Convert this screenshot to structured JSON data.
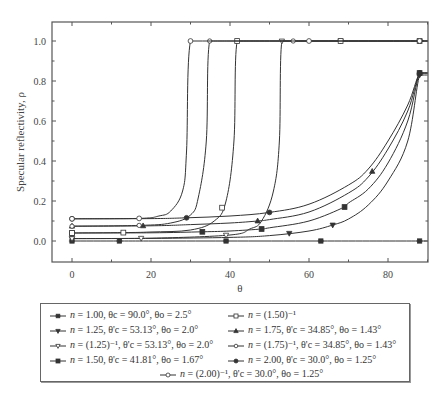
{
  "chart_data": {
    "type": "line",
    "title": "",
    "xlabel": "θ",
    "ylabel": "Specular reflectivity, ρ",
    "xlim": [
      -5,
      90
    ],
    "ylim": [
      -0.105,
      1.095
    ],
    "xticks": [
      0,
      20,
      40,
      60,
      80
    ],
    "yticks": [
      0.0,
      0.2,
      0.4,
      0.6,
      0.8,
      1.0
    ],
    "grid": false,
    "legend_position": "below",
    "series": [
      {
        "name": "n = 1.00, θc = 90.0°, θo = 2.5°",
        "marker": "asterisk",
        "x": [
          0,
          12,
          21,
          39,
          63,
          88,
          90
        ],
        "y": [
          0,
          0,
          0,
          0,
          0,
          0,
          0
        ]
      },
      {
        "name": "n = 1.25, θ'c = 53.13°, θo = 2.0°",
        "marker": "triangle-down-filled",
        "x": [
          0,
          20,
          40,
          50,
          60,
          66,
          70,
          75,
          80,
          85,
          88,
          90
        ],
        "y": [
          0.012,
          0.013,
          0.018,
          0.027,
          0.05,
          0.08,
          0.11,
          0.18,
          0.3,
          0.5,
          0.83,
          0.83
        ]
      },
      {
        "name": "n = (1.25)⁻¹, θ'c = 53.13°, θo = 2.0°",
        "marker": "triangle-down-open",
        "x": [
          0,
          20,
          40,
          45,
          48,
          51,
          52.5,
          53.13,
          60,
          70,
          80,
          90
        ],
        "y": [
          0.012,
          0.014,
          0.03,
          0.06,
          0.1,
          0.25,
          0.5,
          1.0,
          1.0,
          1.0,
          1.0,
          1.0
        ]
      },
      {
        "name": "n = 1.50, θ'c = 41.81°, θo = 1.67°",
        "marker": "square-filled",
        "x": [
          0,
          20,
          33,
          40,
          48,
          50,
          60,
          69,
          70,
          75,
          80,
          85,
          88,
          90
        ],
        "y": [
          0.04,
          0.041,
          0.046,
          0.05,
          0.06,
          0.066,
          0.1,
          0.17,
          0.19,
          0.26,
          0.39,
          0.6,
          0.84,
          0.84
        ]
      },
      {
        "name": "n = (1.50)⁻¹",
        "marker": "square-open",
        "x": [
          0,
          13,
          20,
          30,
          36,
          39,
          41,
          41.81,
          50,
          60,
          70,
          80,
          90
        ],
        "y": [
          0.04,
          0.042,
          0.045,
          0.055,
          0.1,
          0.2,
          0.5,
          1.0,
          1.0,
          1.0,
          1.0,
          1.0,
          1.0
        ]
      },
      {
        "name": "n = 1.75, θ'c = 34.85°, θo = 1.43°",
        "marker": "triangle-up-filled",
        "x": [
          0,
          20,
          30,
          40,
          47,
          50,
          60,
          70,
          75,
          80,
          85,
          88,
          90
        ],
        "y": [
          0.074,
          0.076,
          0.082,
          0.09,
          0.1,
          0.107,
          0.145,
          0.24,
          0.32,
          0.46,
          0.65,
          0.84,
          0.84
        ]
      },
      {
        "name": "n = (1.75)⁻¹, θ'c = 34.85°, θo = 1.43°",
        "marker": "circle-open-small",
        "x": [
          0,
          17,
          25,
          30,
          32,
          34,
          34.85,
          40,
          50,
          60,
          70,
          80,
          90
        ],
        "y": [
          0.074,
          0.078,
          0.09,
          0.13,
          0.22,
          0.5,
          1.0,
          1.0,
          1.0,
          1.0,
          1.0,
          1.0,
          1.0
        ]
      },
      {
        "name": "n = 2.00, θ'c = 30.0°, θo = 1.25°",
        "marker": "circle-filled",
        "x": [
          0,
          20,
          29,
          40,
          50,
          60,
          70,
          75,
          80,
          85,
          88,
          90
        ],
        "y": [
          0.111,
          0.112,
          0.116,
          0.125,
          0.143,
          0.184,
          0.28,
          0.36,
          0.5,
          0.68,
          0.84,
          0.84
        ]
      },
      {
        "name": "n = (2.00)⁻¹, θ'c = 30.0°, θo = 1.25°",
        "marker": "circle-open",
        "x": [
          0,
          17,
          22,
          25,
          28,
          29,
          30,
          40,
          50,
          60,
          70,
          80,
          90
        ],
        "y": [
          0.111,
          0.113,
          0.125,
          0.15,
          0.25,
          0.45,
          1.0,
          1.0,
          1.0,
          1.0,
          1.0,
          1.0,
          1.0
        ]
      }
    ]
  },
  "axes": {
    "xlabel": "θ",
    "ylabel": "Specular reflectivity, ρ",
    "xtick_labels": [
      "0",
      "20",
      "40",
      "60",
      "80"
    ],
    "ytick_labels": [
      "0.0",
      "0.2",
      "0.4",
      "0.6",
      "0.8",
      "1.0"
    ]
  },
  "legend": {
    "items": [
      {
        "pre": "",
        "n": "n",
        "text": " = 1.00, θc = 90.0°, θo = 2.5°"
      },
      {
        "pre": "",
        "n": "n",
        "text": " = (1.50)⁻¹"
      },
      {
        "pre": "",
        "n": "n",
        "text": " = 1.25, θ'c = 53.13°, θo = 2.0°"
      },
      {
        "pre": "",
        "n": "n",
        "text": " = 1.75, θ'c = 34.85°, θo = 1.43°"
      },
      {
        "pre": "",
        "n": "n",
        "text": " = (1.25)⁻¹, θ'c = 53.13°, θo = 2.0°"
      },
      {
        "pre": "",
        "n": "n",
        "text": " = (1.75)⁻¹, θ'c = 34.85°, θo = 1.43°"
      },
      {
        "pre": "",
        "n": "n",
        "text": " = 1.50, θ'c = 41.81°, θo = 1.67°"
      },
      {
        "pre": "",
        "n": "n",
        "text": " = 2.00, θ'c = 30.0°, θo = 1.25°"
      },
      {
        "pre": "",
        "n": "n",
        "text": " = (2.00)⁻¹, θ'c = 30.0°, θo = 1.25°"
      }
    ]
  },
  "colors": {
    "line": "#333333",
    "axis": "#555555"
  }
}
